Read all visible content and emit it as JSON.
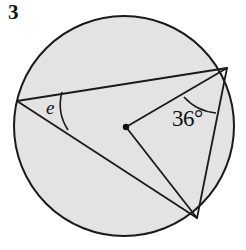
{
  "figure": {
    "question_number": "3",
    "type": "circle-geometry-diagram",
    "background_color": "#ffffff",
    "circle": {
      "name": "main-circle",
      "center_x": 124,
      "center_y": 126,
      "radius": 110,
      "fill_color": "#e3e3e3",
      "stroke_color": "#1a1a1a",
      "stroke_width": 2.0
    },
    "center_point": {
      "name": "circle-center-dot",
      "x": 126,
      "y": 127,
      "radius": 3.2,
      "color": "#111111"
    },
    "vertices": [
      {
        "id": "A",
        "role": "inscribed-angle-vertex",
        "x": 17,
        "y": 101
      },
      {
        "id": "B",
        "role": "upper-right-point",
        "x": 227,
        "y": 68
      },
      {
        "id": "C",
        "role": "lower-point",
        "x": 197,
        "y": 218
      }
    ],
    "segments": [
      {
        "name": "chord-A-B",
        "from": "A",
        "to": "B",
        "x1": 17,
        "y1": 101,
        "x2": 227,
        "y2": 68
      },
      {
        "name": "chord-A-C",
        "from": "A",
        "to": "C",
        "x1": 17,
        "y1": 101,
        "x2": 197,
        "y2": 218
      },
      {
        "name": "chord-B-C",
        "from": "B",
        "to": "C",
        "x1": 227,
        "y1": 68,
        "x2": 197,
        "y2": 218
      },
      {
        "name": "radius-O-B",
        "from": "O",
        "to": "B",
        "x1": 126,
        "y1": 127,
        "x2": 227,
        "y2": 68
      },
      {
        "name": "radius-O-C",
        "from": "O",
        "to": "C",
        "x1": 126,
        "y1": 127,
        "x2": 197,
        "y2": 218
      }
    ],
    "segment_stroke_color": "#1a1a1a",
    "segment_stroke_width": 1.8,
    "angle_arcs": [
      {
        "name": "angle-arc-e",
        "at_vertex": "A",
        "path": "M 62 92 A 47 47 0 0 0 68 130",
        "stroke_color": "#1a1a1a",
        "stroke_width": 1.6
      },
      {
        "name": "angle-arc-36",
        "at_vertex": "B",
        "path": "M 184 97 A 49 49 0 0 0 216 113",
        "stroke_color": "#1a1a1a",
        "stroke_width": 1.6
      }
    ],
    "labels": {
      "angle_e": "e",
      "angle_36": "36°"
    }
  }
}
